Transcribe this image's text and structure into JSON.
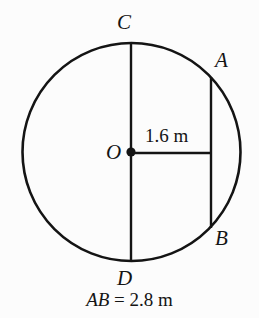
{
  "figure": {
    "type": "geometry-diagram",
    "background_color": "#fcfcfc",
    "stroke_color": "#141414",
    "circle": {
      "center_x": 131.5,
      "center_y": 152,
      "radius": 109,
      "stroke_width": 2.6
    },
    "diameter_CD": {
      "x": 131,
      "y_top": 43,
      "y_bottom": 262,
      "stroke_width": 2.4
    },
    "chord_AB": {
      "x": 211,
      "y_top": 77,
      "y_bottom": 228,
      "stroke_width": 2.4
    },
    "radius_segment": {
      "x_start": 131,
      "x_end": 211,
      "y": 153,
      "stroke_width": 2.4
    },
    "center_dot": {
      "cx": 131,
      "cy": 152,
      "r": 4.6
    }
  },
  "labels": {
    "point_c": "C",
    "point_d": "D",
    "point_a": "A",
    "point_b": "B",
    "center_o": "O",
    "radius_measure": "1.6 m"
  },
  "caption": {
    "segment_name": "AB",
    "value_text": " = 2.8 m"
  }
}
